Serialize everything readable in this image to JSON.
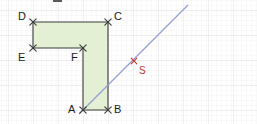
{
  "figure": {
    "title": "",
    "colors": {
      "polygon_fill": "#e4f0d4",
      "polygon_stroke": "#3a3a3a",
      "grid_major": "#e3e3e3",
      "grid_minor": "#f2f2f2",
      "line_stroke": "#8f9ad4",
      "marker_stroke": "#3a3a3a",
      "point_s_color": "#c0392b",
      "background": "#ffffff"
    },
    "grid": {
      "major_spacing_px": 25,
      "minor_spacing_px": 5,
      "origin_x_px": 8,
      "origin_y_px": 10,
      "visible": true
    },
    "polygon": {
      "name": "L-shaped-polygon",
      "vertex_order": [
        "A",
        "B",
        "C",
        "D",
        "E",
        "F"
      ],
      "closed": true
    },
    "vertices": [
      {
        "id": "A",
        "label": "A",
        "x": 83,
        "y": 110,
        "label_x": 68,
        "label_y": 104,
        "marker": "x-cross"
      },
      {
        "id": "B",
        "label": "B",
        "x": 108,
        "y": 110,
        "label_x": 114,
        "label_y": 104,
        "marker": "x-cross"
      },
      {
        "id": "C",
        "label": "C",
        "x": 108,
        "y": 22,
        "label_x": 114,
        "label_y": 11,
        "marker": "x-cross"
      },
      {
        "id": "D",
        "label": "D",
        "x": 33,
        "y": 22,
        "label_x": 18,
        "label_y": 11,
        "marker": "x-cross"
      },
      {
        "id": "E",
        "label": "E",
        "x": 33,
        "y": 48,
        "label_x": 18,
        "label_y": 52,
        "marker": "x-cross"
      },
      {
        "id": "F",
        "label": "F",
        "x": 83,
        "y": 48,
        "label_x": 71,
        "label_y": 52,
        "marker": "x-cross"
      }
    ],
    "points": [
      {
        "id": "S",
        "label": "S",
        "x": 134,
        "y": 61,
        "label_x": 139,
        "label_y": 66,
        "marker": "x-cross",
        "color": "#c0392b"
      }
    ],
    "lines": [
      {
        "id": "line-AS",
        "name": "diagonal-line-through-A-and-S",
        "x1": 79,
        "y1": 114,
        "x2": 188,
        "y2": 5,
        "color": "#8f9ad4"
      }
    ],
    "artifacts": [
      {
        "id": "top-clipped-mark",
        "x": 53,
        "y": 0,
        "width": 9,
        "height": 2
      }
    ]
  }
}
